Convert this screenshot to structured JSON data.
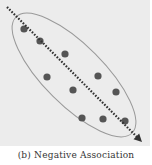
{
  "chart_data": {
    "type": "scatter",
    "title": "",
    "caption": "(b) Negative Association",
    "xlabel": "",
    "ylabel": "",
    "grid": false,
    "legend": "none",
    "points": [
      {
        "x": 24,
        "y": 29
      },
      {
        "x": 40,
        "y": 41
      },
      {
        "x": 65,
        "y": 54
      },
      {
        "x": 47,
        "y": 77
      },
      {
        "x": 73,
        "y": 90
      },
      {
        "x": 98,
        "y": 76
      },
      {
        "x": 116,
        "y": 92
      },
      {
        "x": 82,
        "y": 118
      },
      {
        "x": 103,
        "y": 119
      },
      {
        "x": 125,
        "y": 121
      }
    ],
    "trend_line": {
      "style": "dotted-arrow",
      "from": {
        "x": 7,
        "y": 7
      },
      "to": {
        "x": 142,
        "y": 142
      },
      "direction": "negative"
    },
    "ellipse": {
      "cx": 74,
      "cy": 75,
      "rx": 82,
      "ry": 30,
      "rotation_deg": 45
    },
    "colors": {
      "background": "#ececec",
      "points": "#555555",
      "trend": "#333333",
      "ellipse": "#999999"
    }
  }
}
